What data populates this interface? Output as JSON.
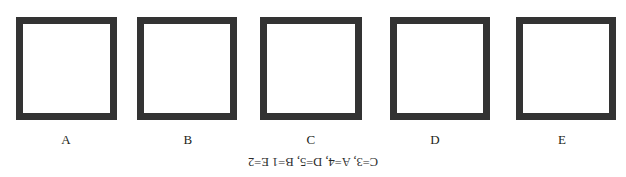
{
  "figure": {
    "stroke_color": "#333333",
    "fill_color": "#ffffff",
    "background_color": "#ffffff",
    "border_width_px": 7,
    "shapes": [
      {
        "id": "square-a",
        "label": "A",
        "x": 16,
        "y": 17,
        "width": 101,
        "height": 103,
        "label_center_x": 66,
        "label_y": 133
      },
      {
        "id": "square-b",
        "label": "B",
        "x": 137,
        "y": 17,
        "width": 100,
        "height": 103,
        "label_center_x": 188,
        "label_y": 133
      },
      {
        "id": "square-c",
        "label": "C",
        "x": 260,
        "y": 17,
        "width": 102,
        "height": 103,
        "label_center_x": 311,
        "label_y": 133
      },
      {
        "id": "square-d",
        "label": "D",
        "x": 390,
        "y": 17,
        "width": 100,
        "height": 103,
        "label_center_x": 435,
        "label_y": 133
      },
      {
        "id": "square-e",
        "label": "E",
        "x": 516,
        "y": 17,
        "width": 100,
        "height": 103,
        "label_center_x": 562,
        "label_y": 133
      }
    ]
  },
  "labels": {
    "a": "A",
    "b": "B",
    "c": "C",
    "d": "D",
    "e": "E"
  },
  "answer_key": {
    "text": "C=3, A=4, D=5, B=1 E=2",
    "orientation": "upside-down",
    "rotation_degrees": 180,
    "top": 155,
    "color": "#2b2b2b"
  }
}
